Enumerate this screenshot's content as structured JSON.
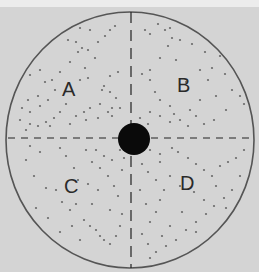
{
  "figure": {
    "background_color": "#d4d4d4",
    "dish": {
      "cx": 130,
      "cy": 140,
      "rx": 124,
      "ry": 128,
      "stroke": "#555555"
    },
    "center_disc": {
      "cx": 134,
      "cy": 139,
      "r": 16,
      "fill": "#0a0a0a"
    },
    "axes": {
      "horizontal": {
        "y": 138,
        "x1": 8,
        "x2": 252
      },
      "vertical": {
        "x": 131,
        "y1": 12,
        "y2": 268
      }
    },
    "quadrants": [
      {
        "label": "A",
        "x": 62,
        "y": 96
      },
      {
        "label": "B",
        "x": 177,
        "y": 92
      },
      {
        "label": "C",
        "x": 64,
        "y": 193
      },
      {
        "label": "D",
        "x": 180,
        "y": 190
      }
    ],
    "colonies": [
      [
        30,
        75
      ],
      [
        40,
        70
      ],
      [
        45,
        82
      ],
      [
        38,
        96
      ],
      [
        28,
        100
      ],
      [
        22,
        108
      ],
      [
        30,
        112
      ],
      [
        40,
        106
      ],
      [
        48,
        100
      ],
      [
        55,
        90
      ],
      [
        52,
        80
      ],
      [
        60,
        72
      ],
      [
        70,
        62
      ],
      [
        78,
        52
      ],
      [
        82,
        48
      ],
      [
        88,
        50
      ],
      [
        76,
        42
      ],
      [
        68,
        40
      ],
      [
        98,
        42
      ],
      [
        110,
        30
      ],
      [
        115,
        26
      ],
      [
        105,
        36
      ],
      [
        95,
        58
      ],
      [
        85,
        68
      ],
      [
        80,
        80
      ],
      [
        88,
        78
      ],
      [
        104,
        86
      ],
      [
        102,
        90
      ],
      [
        110,
        92
      ],
      [
        116,
        98
      ],
      [
        112,
        108
      ],
      [
        108,
        112
      ],
      [
        100,
        104
      ],
      [
        90,
        108
      ],
      [
        84,
        112
      ],
      [
        76,
        116
      ],
      [
        66,
        104
      ],
      [
        60,
        112
      ],
      [
        54,
        118
      ],
      [
        46,
        122
      ],
      [
        38,
        126
      ],
      [
        30,
        124
      ],
      [
        20,
        120
      ],
      [
        26,
        130
      ],
      [
        50,
        126
      ],
      [
        70,
        124
      ],
      [
        86,
        120
      ],
      [
        98,
        118
      ],
      [
        112,
        116
      ],
      [
        120,
        108
      ],
      [
        118,
        72
      ],
      [
        110,
        76
      ],
      [
        90,
        30
      ],
      [
        80,
        28
      ],
      [
        145,
        30
      ],
      [
        150,
        34
      ],
      [
        158,
        24
      ],
      [
        165,
        30
      ],
      [
        170,
        28
      ],
      [
        172,
        38
      ],
      [
        168,
        46
      ],
      [
        160,
        58
      ],
      [
        176,
        60
      ],
      [
        150,
        70
      ],
      [
        142,
        74
      ],
      [
        150,
        80
      ],
      [
        155,
        92
      ],
      [
        160,
        100
      ],
      [
        170,
        106
      ],
      [
        174,
        114
      ],
      [
        180,
        120
      ],
      [
        190,
        110
      ],
      [
        196,
        116
      ],
      [
        200,
        100
      ],
      [
        208,
        80
      ],
      [
        212,
        68
      ],
      [
        220,
        56
      ],
      [
        225,
        74
      ],
      [
        232,
        90
      ],
      [
        240,
        96
      ],
      [
        244,
        104
      ],
      [
        226,
        110
      ],
      [
        214,
        120
      ],
      [
        204,
        124
      ],
      [
        188,
        126
      ],
      [
        170,
        122
      ],
      [
        160,
        116
      ],
      [
        150,
        112
      ],
      [
        148,
        124
      ],
      [
        140,
        118
      ],
      [
        180,
        40
      ],
      [
        192,
        44
      ],
      [
        205,
        52
      ],
      [
        200,
        70
      ],
      [
        186,
        82
      ],
      [
        216,
        96
      ],
      [
        30,
        146
      ],
      [
        40,
        152
      ],
      [
        26,
        160
      ],
      [
        34,
        176
      ],
      [
        46,
        188
      ],
      [
        56,
        190
      ],
      [
        62,
        202
      ],
      [
        70,
        210
      ],
      [
        76,
        204
      ],
      [
        84,
        220
      ],
      [
        90,
        226
      ],
      [
        96,
        230
      ],
      [
        100,
        236
      ],
      [
        104,
        240
      ],
      [
        110,
        244
      ],
      [
        116,
        236
      ],
      [
        120,
        226
      ],
      [
        122,
        214
      ],
      [
        118,
        196
      ],
      [
        114,
        186
      ],
      [
        108,
        176
      ],
      [
        100,
        168
      ],
      [
        92,
        162
      ],
      [
        86,
        150
      ],
      [
        96,
        150
      ],
      [
        104,
        156
      ],
      [
        112,
        160
      ],
      [
        120,
        150
      ],
      [
        124,
        158
      ],
      [
        74,
        168
      ],
      [
        66,
        156
      ],
      [
        60,
        148
      ],
      [
        78,
        180
      ],
      [
        88,
        184
      ],
      [
        98,
        190
      ],
      [
        110,
        210
      ],
      [
        80,
        240
      ],
      [
        60,
        232
      ],
      [
        48,
        218
      ],
      [
        36,
        208
      ],
      [
        92,
        204
      ],
      [
        72,
        226
      ],
      [
        122,
        170
      ],
      [
        150,
        150
      ],
      [
        160,
        154
      ],
      [
        172,
        148
      ],
      [
        178,
        152
      ],
      [
        188,
        158
      ],
      [
        196,
        164
      ],
      [
        204,
        170
      ],
      [
        212,
        176
      ],
      [
        220,
        166
      ],
      [
        228,
        162
      ],
      [
        236,
        158
      ],
      [
        244,
        150
      ],
      [
        240,
        176
      ],
      [
        232,
        190
      ],
      [
        224,
        198
      ],
      [
        214,
        206
      ],
      [
        206,
        214
      ],
      [
        196,
        222
      ],
      [
        186,
        230
      ],
      [
        176,
        240
      ],
      [
        166,
        246
      ],
      [
        156,
        252
      ],
      [
        148,
        244
      ],
      [
        142,
        234
      ],
      [
        150,
        222
      ],
      [
        156,
        212
      ],
      [
        160,
        200
      ],
      [
        164,
        190
      ],
      [
        156,
        180
      ],
      [
        148,
        172
      ],
      [
        142,
        164
      ],
      [
        170,
        176
      ],
      [
        180,
        186
      ],
      [
        194,
        192
      ],
      [
        204,
        200
      ],
      [
        170,
        226
      ],
      [
        182,
        212
      ],
      [
        196,
        232
      ],
      [
        216,
        186
      ],
      [
        226,
        208
      ],
      [
        160,
        162
      ],
      [
        140,
        190
      ],
      [
        146,
        204
      ],
      [
        150,
        258
      ],
      [
        162,
        236
      ]
    ]
  }
}
